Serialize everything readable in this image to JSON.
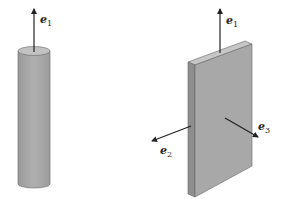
{
  "figure": {
    "rod": {
      "axis": {
        "symbol": "e",
        "subscript": "1"
      }
    },
    "plate": {
      "axes": [
        {
          "symbol": "e",
          "subscript": "1"
        },
        {
          "symbol": "e",
          "subscript": "2"
        },
        {
          "symbol": "e",
          "subscript": "3"
        }
      ]
    },
    "colors": {
      "body_fill": "#a9a9a9",
      "top_fill": "#c4c4c4",
      "side_fill": "#8f8f8f",
      "arrow": "#222222"
    }
  }
}
